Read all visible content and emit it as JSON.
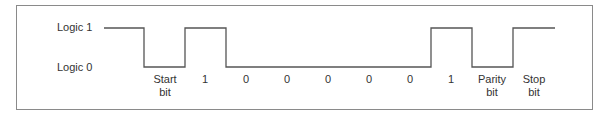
{
  "diagram": {
    "levels": {
      "high_label": "Logic 1",
      "low_label": "Logic 0"
    },
    "bits": [
      {
        "label_line1": "Start",
        "label_line2": "bit",
        "level": 0
      },
      {
        "label_line1": "1",
        "label_line2": "",
        "level": 1
      },
      {
        "label_line1": "0",
        "label_line2": "",
        "level": 0
      },
      {
        "label_line1": "0",
        "label_line2": "",
        "level": 0
      },
      {
        "label_line1": "0",
        "label_line2": "",
        "level": 0
      },
      {
        "label_line1": "0",
        "label_line2": "",
        "level": 0
      },
      {
        "label_line1": "0",
        "label_line2": "",
        "level": 0
      },
      {
        "label_line1": "1",
        "label_line2": "",
        "level": 1
      },
      {
        "label_line1": "Parity",
        "label_line2": "bit",
        "level": 0
      },
      {
        "label_line1": "Stop",
        "label_line2": "bit",
        "level": 1
      }
    ],
    "line_color": "#555555",
    "frame_color": "#8a8a8a"
  }
}
